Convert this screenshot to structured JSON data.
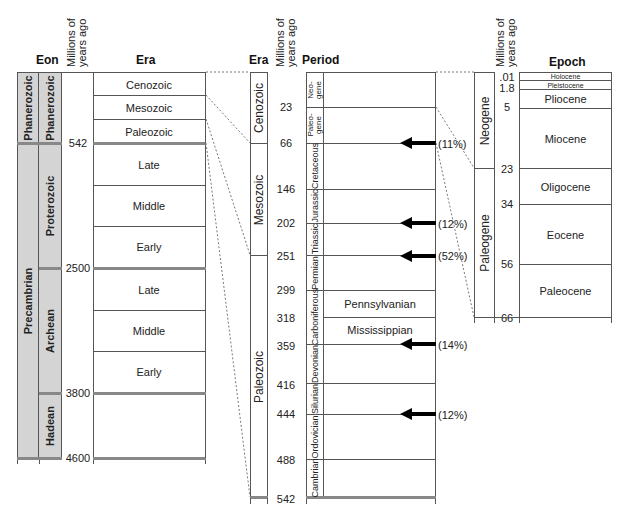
{
  "headers": {
    "eon": "Eon",
    "myago": [
      "Millions of",
      "years ago"
    ],
    "era": "Era",
    "era2": "Era",
    "period": "Period",
    "epoch": "Epoch"
  },
  "left": {
    "eon_outer": [
      {
        "label": "Phanerozoic"
      },
      {
        "label": "Precambrian"
      }
    ],
    "eon_inner": [
      {
        "label": "Phanerozoic"
      },
      {
        "label": "Proterozoic"
      },
      {
        "label": "Archean"
      },
      {
        "label": "Hadean"
      }
    ],
    "boundaries": [
      "542",
      "2500",
      "3800",
      "4600"
    ],
    "eras": [
      {
        "label": "Cenozoic"
      },
      {
        "label": "Mesozoic"
      },
      {
        "label": "Paleozoic"
      },
      {
        "label": "Late"
      },
      {
        "label": "Middle"
      },
      {
        "label": "Early"
      },
      {
        "label": "Late"
      },
      {
        "label": "Middle"
      },
      {
        "label": "Early"
      },
      {
        "label": ""
      }
    ]
  },
  "middle": {
    "eras": [
      {
        "label": "Cenozoic"
      },
      {
        "label": "Mesozoic"
      },
      {
        "label": "Paleozoic"
      }
    ],
    "boundaries": [
      "23",
      "66",
      "146",
      "202",
      "251",
      "299",
      "318",
      "359",
      "416",
      "444",
      "488",
      "542"
    ],
    "periods": [
      {
        "label": "Neo-gene"
      },
      {
        "label": "Paleo-gene"
      },
      {
        "label": "Cretaceous"
      },
      {
        "label": "Jurassic"
      },
      {
        "label": "Triassic"
      },
      {
        "label": "Permian"
      },
      {
        "label": "Carboniferous"
      },
      {
        "label": "Devonian"
      },
      {
        "label": "Silurian"
      },
      {
        "label": "Ordovician"
      },
      {
        "label": "Cambrian"
      }
    ],
    "subperiods": [
      {
        "label": "Pennsylvanian"
      },
      {
        "label": "Mississippian"
      }
    ],
    "extinctions": [
      {
        "at": "66",
        "pct": "(11%)"
      },
      {
        "at": "202",
        "pct": "(12%)"
      },
      {
        "at": "251",
        "pct": "(52%)"
      },
      {
        "at": "359",
        "pct": "(14%)"
      },
      {
        "at": "444",
        "pct": "(12%)"
      }
    ]
  },
  "right": {
    "periods": [
      {
        "label": "Neogene"
      },
      {
        "label": "Paleogene"
      }
    ],
    "boundaries": [
      ".01",
      "1.8",
      "5",
      "23",
      "34",
      "56",
      "66"
    ],
    "epochs": [
      {
        "label": "Holocene"
      },
      {
        "label": "Pleistocene"
      },
      {
        "label": "Pliocene"
      },
      {
        "label": "Miocene"
      },
      {
        "label": "Oligocene"
      },
      {
        "label": "Eocene"
      },
      {
        "label": "Paleocene"
      }
    ]
  }
}
